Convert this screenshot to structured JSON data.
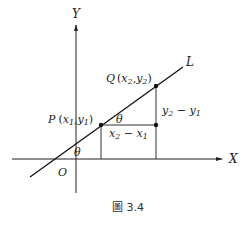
{
  "figure": {
    "caption": "圖 3.4",
    "axes": {
      "x_label": "X",
      "y_label": "Y",
      "origin_label": "O"
    },
    "line_label": "L",
    "points": {
      "P": {
        "name": "P",
        "open": "(",
        "x": "x",
        "x_sub": "1",
        "comma": ",",
        "y": "y",
        "y_sub": "1",
        "close": ")"
      },
      "Q": {
        "name": "Q",
        "open": "(",
        "x": "x",
        "x_sub": "2",
        "comma": ",",
        "y": "y",
        "y_sub": "2",
        "close": ")"
      }
    },
    "angles": {
      "at_x_axis": "θ",
      "at_P": "θ"
    },
    "segments": {
      "rise": {
        "a": "y",
        "a_sub": "2",
        "op": " − ",
        "b": "y",
        "b_sub": "1"
      },
      "run": {
        "a": "x",
        "a_sub": "2",
        "op": " − ",
        "b": "x",
        "b_sub": "1"
      }
    },
    "colors": {
      "line": "#111111",
      "axis": "#222222",
      "text": "#222222"
    }
  }
}
